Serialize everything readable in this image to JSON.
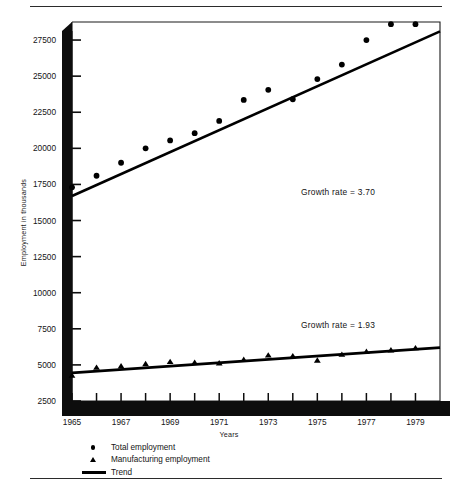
{
  "chart_data": {
    "type": "scatter",
    "title": "",
    "xlabel": "Years",
    "ylabel": "Employment in thousands",
    "xlim": [
      1965,
      1980
    ],
    "ylim": [
      2500,
      28750
    ],
    "yticks": [
      2500,
      5000,
      7500,
      10000,
      12500,
      15000,
      17500,
      20000,
      22500,
      25000,
      27500
    ],
    "xticks": [
      1965,
      1966,
      1967,
      1968,
      1969,
      1970,
      1971,
      1972,
      1973,
      1974,
      1975,
      1976,
      1977,
      1978,
      1979
    ],
    "xtick_labels": [
      "1965",
      "",
      "1967",
      "",
      "1969",
      "",
      "1971",
      "",
      "1973",
      "",
      "1975",
      "",
      "1977",
      "",
      "1979"
    ],
    "grid": false,
    "legend_position": "below-axes",
    "x": [
      1965,
      1966,
      1967,
      1968,
      1969,
      1970,
      1971,
      1972,
      1973,
      1974,
      1975,
      1976,
      1977,
      1978,
      1979
    ],
    "series": [
      {
        "name": "Total employment",
        "marker": "circle",
        "values": [
          17300,
          18100,
          19000,
          20000,
          20550,
          21050,
          21900,
          23350,
          24050,
          23400,
          24800,
          25800,
          27500,
          28600,
          28600
        ]
      },
      {
        "name": "Manufacturing employment",
        "marker": "triangle",
        "values": [
          4250,
          4800,
          4900,
          5050,
          5200,
          5150,
          5100,
          5350,
          5650,
          5600,
          5300,
          5700,
          5900,
          6000,
          6150
        ]
      }
    ],
    "trend_lines": [
      {
        "name": "Total employment trend",
        "growth_rate": 3.7,
        "annotation": "Growth rate = 3.70",
        "x_start": 1965,
        "y_start": 16700,
        "x_end": 1980,
        "y_end": 28100
      },
      {
        "name": "Manufacturing employment trend",
        "growth_rate": 1.93,
        "annotation": "Growth rate = 1.93",
        "x_start": 1965,
        "y_start": 4450,
        "x_end": 1980,
        "y_end": 6200
      }
    ]
  },
  "axes": {
    "ylabel": "Employment in thousands",
    "xlabel": "Years",
    "ytick_labels": [
      "27500",
      "25000",
      "22500",
      "20000",
      "17500",
      "15000",
      "12500",
      "10000",
      "7500",
      "5000",
      "2500"
    ],
    "xtick_labels": [
      "1965",
      "1967",
      "1969",
      "1971",
      "1973",
      "1975",
      "1977",
      "1979"
    ]
  },
  "annotations": {
    "upper": "Growth rate = 3.70",
    "lower": "Growth rate = 1.93"
  },
  "legend": {
    "items": [
      {
        "label": "Total employment",
        "marker": "circle-marker"
      },
      {
        "label": "Manufacturing employment",
        "marker": "triangle-marker"
      },
      {
        "label": "Trend",
        "marker": "line-marker"
      }
    ]
  },
  "colors": {
    "ink": "#000000",
    "paper": "#ffffff",
    "rule": "#2b2b2b"
  }
}
